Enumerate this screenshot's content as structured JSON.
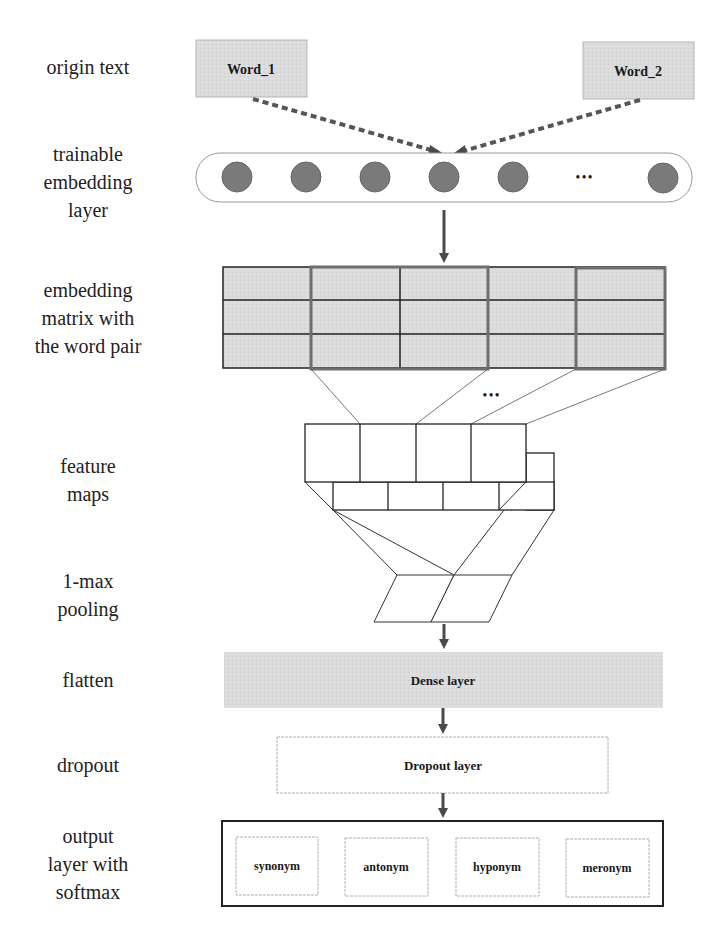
{
  "diagram": {
    "type": "neural-network-architecture",
    "stages": [
      {
        "id": "origin",
        "label": "origin text"
      },
      {
        "id": "embed",
        "label": "trainable embedding layer"
      },
      {
        "id": "matrix",
        "label": "embedding matrix with the word pair"
      },
      {
        "id": "features",
        "label": "feature maps"
      },
      {
        "id": "pooling",
        "label": "1-max pooling"
      },
      {
        "id": "flatten",
        "label": "flatten"
      },
      {
        "id": "dropout",
        "label": "dropout"
      },
      {
        "id": "output",
        "label": "output layer with softmax"
      }
    ]
  },
  "labels": {
    "origin_text": "origin text",
    "trainable_embedding": [
      "trainable",
      "embedding",
      "layer"
    ],
    "embedding_matrix": [
      "embedding",
      "matrix with",
      "the word pair"
    ],
    "feature_maps": [
      "feature",
      "maps"
    ],
    "pooling": [
      "1-max",
      "pooling"
    ],
    "flatten": "flatten",
    "dropout": "dropout",
    "output": [
      "output",
      "layer with",
      "softmax"
    ]
  },
  "nodes": {
    "word1": "Word_1",
    "word2": "Word_2",
    "embedding_ellipsis": "•••",
    "matrix_ellipsis": "•••",
    "dense": "Dense layer",
    "dropout": "Dropout layer",
    "classes": [
      "synonym",
      "antonym",
      "hyponym",
      "meronym"
    ]
  },
  "colors": {
    "box_fill": "#dcdcdc",
    "circle_fill": "#7a7a7a",
    "arrow": "#4a4a4a",
    "highlight_border": "#6e6e6e",
    "line": "#222222"
  }
}
